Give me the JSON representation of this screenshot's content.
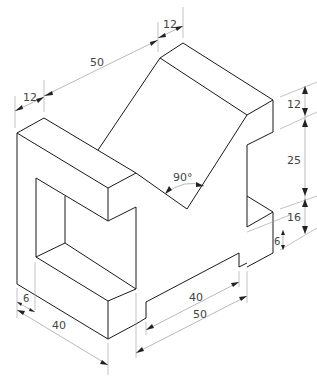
{
  "drawing": {
    "type": "isometric technical drawing",
    "colors": {
      "object_lines": "#1a1a1a",
      "dimension_lines": "#8a8a8a",
      "text": "#444444",
      "background": "#ffffff"
    }
  },
  "dimensions": {
    "top_left_width": "12",
    "top_slope_length": "50",
    "top_right_width": "12",
    "right_top_height": "12",
    "right_middle_height": "25",
    "right_lower_height": "16",
    "right_small_step": "6",
    "v_angle": "90°",
    "bottom_left_inset": "6",
    "bottom_left_depth": "40",
    "bottom_inner_length": "40",
    "bottom_outer_length": "50"
  }
}
